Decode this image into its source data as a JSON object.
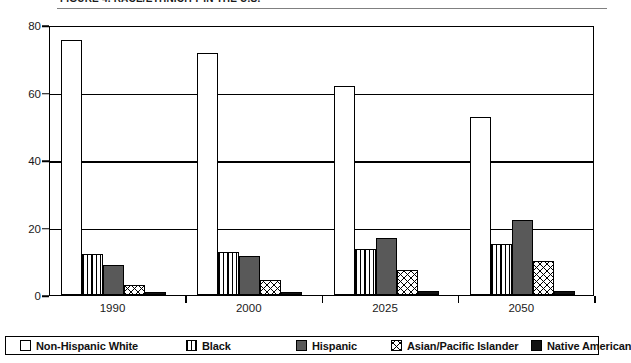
{
  "header": {
    "cut_title": "FIGURE 4. RACE/ETHNICITY IN THE U.S."
  },
  "chart_data": {
    "type": "bar",
    "title": "",
    "subtitle": "",
    "xlabel": "",
    "ylabel": "",
    "ylim": [
      0,
      80
    ],
    "yticks": [
      0,
      20,
      40,
      60,
      80
    ],
    "ytick_labels": [
      "0",
      "20",
      "40",
      "60",
      "80"
    ],
    "grid": true,
    "grid_axis": "y",
    "legend_position": "bottom",
    "categories": [
      "1990",
      "2000",
      "2025",
      "2050"
    ],
    "series": [
      {
        "name": "Non-Hispanic White",
        "pattern": "empty",
        "color": "#ffffff",
        "values": [
          75.7,
          71.8,
          62.0,
          52.8
        ]
      },
      {
        "name": "Black",
        "pattern": "vertical-lines",
        "color": "#ffffff",
        "values": [
          12.3,
          12.6,
          13.6,
          15.0
        ]
      },
      {
        "name": "Hispanic",
        "pattern": "solid-gray",
        "color": "#595959",
        "values": [
          9.0,
          11.5,
          16.8,
          22.3
        ]
      },
      {
        "name": "Asian/Pacific Islander",
        "pattern": "cross-hatch",
        "color": "#ffffff",
        "values": [
          3.0,
          4.4,
          7.5,
          10.0
        ]
      },
      {
        "name": "Native American",
        "pattern": "solid-black",
        "color": "#111111",
        "values": [
          0.8,
          0.9,
          1.1,
          1.2
        ]
      }
    ]
  }
}
